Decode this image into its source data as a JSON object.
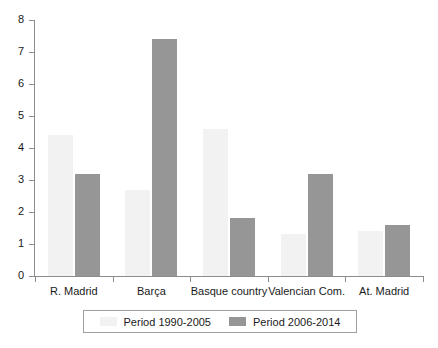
{
  "chart_data": {
    "type": "bar",
    "title": "",
    "subtitle": "",
    "xlabel": "",
    "ylabel": "",
    "categories": [
      "R. Madrid",
      "Barça",
      "Basque country",
      "Valencian Com.",
      "At. Madrid"
    ],
    "series": [
      {
        "name": "Period 1990-2005",
        "color": "#f2f2f2",
        "values": [
          4.4,
          2.7,
          4.6,
          1.3,
          1.4
        ]
      },
      {
        "name": "Period 2006-2014",
        "color": "#969696",
        "values": [
          3.2,
          7.4,
          1.8,
          3.2,
          1.6
        ]
      }
    ],
    "ylim": [
      0,
      8
    ],
    "yticks": [
      0,
      1,
      2,
      3,
      4,
      5,
      6,
      7,
      8
    ],
    "ytick_labels": [
      "0",
      "1",
      "2",
      "3",
      "4",
      "5",
      "6",
      "7",
      "8"
    ],
    "grid": false,
    "legend_position": "bottom"
  },
  "legend": {
    "entries": [
      {
        "label": "Period 1990-2005",
        "swatch": "light-gray-swatch"
      },
      {
        "label": "Period 2006-2014",
        "swatch": "dark-gray-swatch"
      }
    ]
  },
  "colors": {
    "series_light": "#f2f2f2",
    "series_dark": "#969696",
    "axis": "#8c8c8c",
    "text": "#1a1a1a",
    "background": "#ffffff",
    "legend_border": "#a0a0a0"
  }
}
